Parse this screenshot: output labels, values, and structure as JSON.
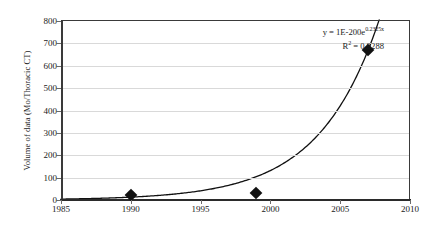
{
  "chart_data": {
    "type": "scatter",
    "title": "",
    "xlabel": "",
    "ylabel": "Volume of data (Mo/Thoracic CT)",
    "xlim": [
      1985,
      2010
    ],
    "ylim": [
      0,
      800
    ],
    "xticks": [
      1985,
      1990,
      1995,
      2000,
      2005,
      2010
    ],
    "yticks": [
      0,
      100,
      200,
      300,
      400,
      500,
      600,
      700,
      800
    ],
    "grid": "horizontal",
    "legend": "none",
    "series": [
      {
        "name": "Volume of data",
        "marker": "diamond",
        "color": "#111111",
        "x": [
          1990,
          1999,
          2007
        ],
        "y": [
          22,
          32,
          670
        ]
      },
      {
        "name": "Exponential trendline",
        "type": "line",
        "color": "#111111",
        "equation": "y = 1E-200e^(0.2325x)",
        "coefficient": 1e-200,
        "rate": 0.2325,
        "r_squared": 0.9288
      }
    ],
    "annotations": [
      {
        "name": "trendline-equation",
        "line1_prefix": "y = 1E-200e",
        "line1_exponent": "0.2325x",
        "line2_prefix": "R",
        "line2_superscript": "2",
        "line2_suffix": " = 0.9288"
      }
    ]
  },
  "axes": {
    "y_title": "Volume of data (Mo/Thoracic CT)",
    "y_tick_labels": [
      "800",
      "700",
      "600",
      "500",
      "400",
      "300",
      "200",
      "100",
      "0"
    ],
    "x_tick_labels": [
      "1985",
      "1990",
      "1995",
      "2000",
      "2005",
      "2010"
    ]
  },
  "colors": {
    "background": "#ffffff",
    "axis": "#2b2b2b",
    "gridline": "#d9d9d9",
    "marker": "#111111",
    "curve": "#111111",
    "text": "#1a1a1a"
  }
}
